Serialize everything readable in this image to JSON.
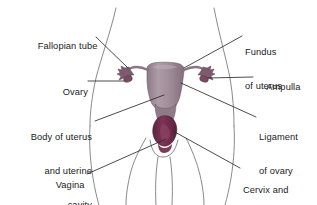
{
  "diagram": {
    "background_color": "#ffffff",
    "outline_color": "#4a4a4a",
    "leader_line_color": "#2b2b2b",
    "text_color": "#1a1a1a",
    "organ_colors": {
      "uterus_body": "#9d8a95",
      "uterus_body_light": "#b4a3ad",
      "cervix": "#6e2d4a",
      "fallopian_tube": "#8a6a7d",
      "ovary": "#7d4a63",
      "outline": "#5a4a54"
    },
    "labels": [
      {
        "id": "fallopian-tube",
        "text": "Fallopian tube",
        "side": "left",
        "lines": [
          "Fallopian tube"
        ]
      },
      {
        "id": "ovary",
        "text": "Ovary",
        "side": "left",
        "lines": [
          "Ovary"
        ]
      },
      {
        "id": "body-of-uterus",
        "text": "Body of uterus and uterine cavity",
        "side": "left",
        "lines": [
          "Body of uterus",
          "and uterine",
          "cavity"
        ]
      },
      {
        "id": "vagina",
        "text": "Vagina",
        "side": "left",
        "lines": [
          "Vagina"
        ]
      },
      {
        "id": "fundus-of-uterus",
        "text": "Fundus of uterus",
        "side": "right",
        "lines": [
          "Fundus",
          "of uterus"
        ]
      },
      {
        "id": "ampulla",
        "text": "Ampulla",
        "side": "right",
        "lines": [
          "Ampulla"
        ]
      },
      {
        "id": "ligament-of-ovary",
        "text": "Ligament of ovary",
        "side": "right",
        "lines": [
          "Ligament",
          "of ovary"
        ]
      },
      {
        "id": "cervix-and-cervical-cavity",
        "text": "Cervix and cervical cavity",
        "side": "right",
        "lines": [
          "Cervix and",
          "cervical cavity"
        ]
      }
    ],
    "label_text": {
      "fallopian_tube": "Fallopian tube",
      "ovary": "Ovary",
      "body_of_uterus_l1": "Body of uterus",
      "body_of_uterus_l2": "and uterine",
      "body_of_uterus_l3": "cavity",
      "vagina": "Vagina",
      "fundus_l1": "Fundus",
      "fundus_l2": "of uterus",
      "ampulla": "Ampulla",
      "ligament_l1": "Ligament",
      "ligament_l2": "of ovary",
      "cervix_l1": "Cervix and",
      "cervix_l2": "cervical cavity"
    }
  }
}
